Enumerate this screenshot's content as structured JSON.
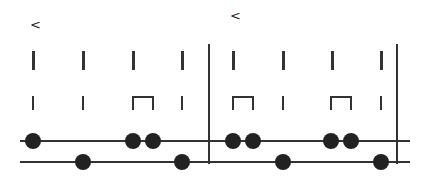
{
  "diagram": {
    "measures": [
      {
        "marker": "<",
        "marker_x": 34
      },
      {
        "marker": "<",
        "marker_x": 234
      }
    ],
    "tall_ticks_x": [
      33,
      83,
      133,
      182,
      233,
      283,
      333,
      381
    ],
    "short_ticks_x": [
      33,
      83,
      182,
      283,
      381
    ],
    "brackets": [
      {
        "x1": 133,
        "x2": 153
      },
      {
        "x1": 233,
        "x2": 253
      },
      {
        "x1": 331,
        "x2": 351
      }
    ],
    "top_line": {
      "y": 141,
      "dots_x": [
        33,
        133,
        153,
        233,
        253,
        331,
        351
      ]
    },
    "bottom_line": {
      "y": 162,
      "dots_x": [
        83,
        182,
        283,
        381
      ]
    },
    "dividers_x": [
      208,
      396
    ],
    "colors": {
      "ink": "#222222",
      "background": "#ffffff"
    }
  }
}
